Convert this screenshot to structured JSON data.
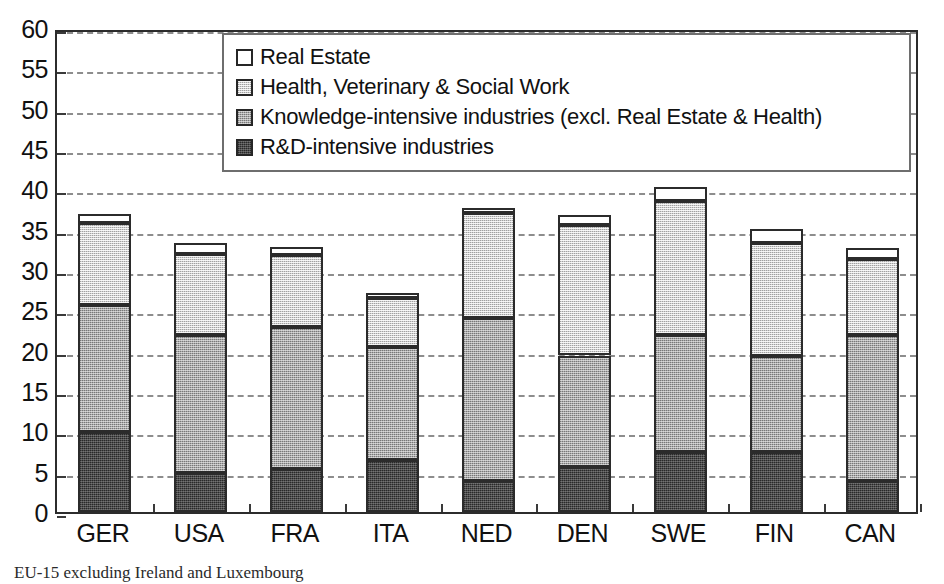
{
  "chart_data": {
    "type": "bar",
    "subtype": "stacked-vertical",
    "title": "",
    "xlabel": "",
    "ylabel": "",
    "ylim": [
      0,
      60
    ],
    "ytick_step": 5,
    "yticks": [
      60,
      55,
      50,
      45,
      40,
      35,
      30,
      25,
      20,
      15,
      10,
      5,
      0
    ],
    "grid": true,
    "grid_axis": "y",
    "grid_style": "dashed",
    "legend_position": "top-center",
    "categories": [
      "GER",
      "USA",
      "FRA",
      "ITA",
      "NED",
      "DEN",
      "SWE",
      "FIN",
      "CAN"
    ],
    "series": [
      {
        "name": "R&D-intensive industries",
        "color": "#4b4b4b",
        "values": [
          9.9,
          4.8,
          5.3,
          6.4,
          3.9,
          5.6,
          7.4,
          7.4,
          3.8
        ]
      },
      {
        "name": "Knowledge-intensive industries (excl. Real Estate & Health)",
        "color": "#a9a9a9",
        "values": [
          15.7,
          17.2,
          17.6,
          14.0,
          20.2,
          13.8,
          14.6,
          12.0,
          18.1
        ]
      },
      {
        "name": "Health, Veterinary & Social Work",
        "color": "#d2d2d2",
        "values": [
          10.2,
          10.0,
          8.9,
          6.1,
          13.0,
          16.2,
          16.6,
          13.9,
          9.5
        ]
      },
      {
        "name": "Real Estate",
        "color": "#ffffff",
        "values": [
          1.1,
          1.3,
          1.1,
          0.6,
          0.6,
          1.2,
          1.7,
          1.8,
          1.3
        ]
      }
    ],
    "totals": [
      36.9,
      33.3,
      32.9,
      27.1,
      37.7,
      36.8,
      40.3,
      35.1,
      32.7
    ]
  },
  "legend": {
    "items": [
      {
        "label": "Real Estate",
        "swatch": "real-estate"
      },
      {
        "label": "Health, Veterinary & Social Work",
        "swatch": "health"
      },
      {
        "label": "Knowledge-intensive industries (excl. Real Estate & Health)",
        "swatch": "knowledge"
      },
      {
        "label": "R&D-intensive industries",
        "swatch": "rnd"
      }
    ]
  },
  "caption": "EU-15 excluding Ireland and Luxembourg"
}
